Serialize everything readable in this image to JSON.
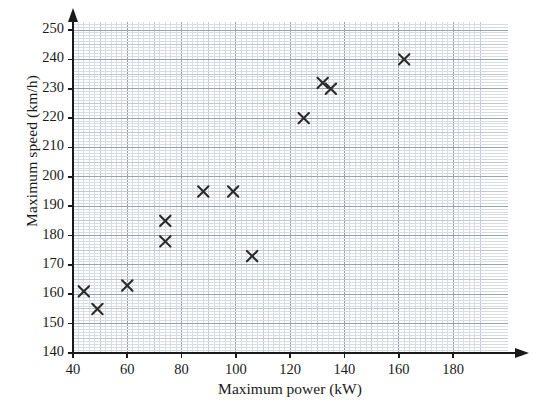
{
  "chart_data": {
    "type": "scatter",
    "title": "",
    "xlabel": "Maximum power (kW)",
    "ylabel": "Maximum speed (km/h)",
    "xlim": [
      40,
      190
    ],
    "ylim": [
      140,
      255
    ],
    "xticks": [
      40,
      60,
      80,
      100,
      120,
      140,
      160,
      180
    ],
    "yticks": [
      140,
      150,
      160,
      170,
      180,
      190,
      200,
      210,
      220,
      230,
      240,
      250
    ],
    "grid": "graph-paper, minor every 2 kW / 1 km-h, major every 10 kW / 5 km-h",
    "legend": "none",
    "marker": "x-cross",
    "marker_color": "#2b2b2b",
    "points": [
      {
        "x": 44,
        "y": 161
      },
      {
        "x": 49,
        "y": 155
      },
      {
        "x": 60,
        "y": 163
      },
      {
        "x": 74,
        "y": 185
      },
      {
        "x": 74,
        "y": 178
      },
      {
        "x": 88,
        "y": 195
      },
      {
        "x": 99,
        "y": 195
      },
      {
        "x": 106,
        "y": 173
      },
      {
        "x": 125,
        "y": 220
      },
      {
        "x": 132,
        "y": 232
      },
      {
        "x": 135,
        "y": 230
      },
      {
        "x": 162,
        "y": 240
      }
    ]
  },
  "axes": {
    "x_tick_labels": [
      "40",
      "60",
      "80",
      "100",
      "120",
      "140",
      "160",
      "180"
    ],
    "y_tick_labels": [
      "140",
      "150",
      "160",
      "170",
      "180",
      "190",
      "200",
      "210",
      "220",
      "230",
      "240",
      "250"
    ],
    "x_axis_title": "Maximum power (kW)",
    "y_axis_title": "Maximum speed (km/h)"
  },
  "colors": {
    "marker": "#2b2b2b",
    "axis": "#1a1a1a",
    "grid_minor": "#d8dde4",
    "grid_mid": "#c2c9d2",
    "grid_major": "#9aa3ad",
    "background": "#ffffff"
  }
}
